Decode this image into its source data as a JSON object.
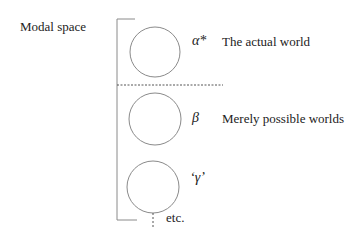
{
  "diagram": {
    "title": "Modal space",
    "worlds": [
      {
        "symbol": "α*",
        "description": "The actual world"
      },
      {
        "symbol": "β",
        "description": "Merely possible worlds"
      },
      {
        "symbol": "‘γ’",
        "description": ""
      }
    ],
    "continuation_label": "etc.",
    "colors": {
      "stroke": "#8a8a8a",
      "text": "#222222"
    }
  }
}
